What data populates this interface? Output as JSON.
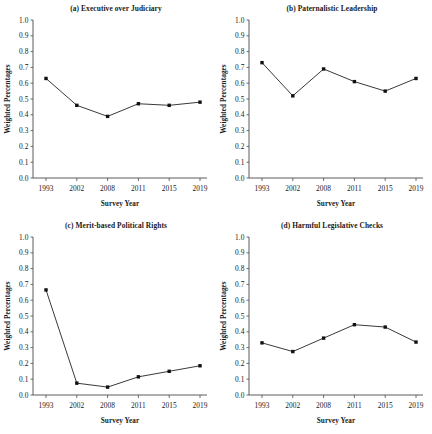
{
  "figure": {
    "panels": [
      {
        "id": "a",
        "title": "(a) Executive over Judiciary",
        "xlabel": "Survey Year",
        "ylabel": "Weighted Percentages"
      },
      {
        "id": "b",
        "title": "(b) Paternalistic Leadership",
        "xlabel": "Survey Year",
        "ylabel": "Weighted Percentages"
      },
      {
        "id": "c",
        "title": "(c) Merit-based Political Rights",
        "xlabel": "Survey Year",
        "ylabel": "Weighted Percentages"
      },
      {
        "id": "d",
        "title": "(d) Harmful Legislative Checks",
        "xlabel": "Survey Year",
        "ylabel": "Weighted Percentages"
      }
    ]
  },
  "chart_data": [
    {
      "type": "line",
      "title": "(a) Executive over Judiciary",
      "xlabel": "Survey Year",
      "ylabel": "Weighted Percentages",
      "categories": [
        "1993",
        "2002",
        "2008",
        "2011",
        "2015",
        "2019"
      ],
      "values": [
        0.63,
        0.46,
        0.39,
        0.47,
        0.46,
        0.48
      ],
      "ylim": [
        0.0,
        1.0
      ],
      "yticks": [
        "0.0",
        "0.1",
        "0.2",
        "0.3",
        "0.4",
        "0.5",
        "0.6",
        "0.7",
        "0.8",
        "0.9",
        "1.0"
      ],
      "grid": false,
      "legend": "none",
      "marker": "square"
    },
    {
      "type": "line",
      "title": "(b) Paternalistic Leadership",
      "xlabel": "Survey Year",
      "ylabel": "Weighted Percentages",
      "categories": [
        "1993",
        "2002",
        "2008",
        "2011",
        "2015",
        "2019"
      ],
      "values": [
        0.73,
        0.52,
        0.69,
        0.61,
        0.55,
        0.63
      ],
      "ylim": [
        0.0,
        1.0
      ],
      "yticks": [
        "0.0",
        "0.1",
        "0.2",
        "0.3",
        "0.4",
        "0.5",
        "0.6",
        "0.7",
        "0.8",
        "0.9",
        "1.0"
      ],
      "grid": false,
      "legend": "none",
      "marker": "square"
    },
    {
      "type": "line",
      "title": "(c) Merit-based Political Rights",
      "xlabel": "Survey Year",
      "ylabel": "Weighted Percentages",
      "categories": [
        "1993",
        "2002",
        "2008",
        "2011",
        "2015",
        "2019"
      ],
      "values": [
        0.665,
        0.075,
        0.05,
        0.115,
        0.15,
        0.185
      ],
      "ylim": [
        0.0,
        1.0
      ],
      "yticks": [
        "0.0",
        "0.1",
        "0.2",
        "0.3",
        "0.4",
        "0.5",
        "0.6",
        "0.7",
        "0.8",
        "0.9",
        "1.0"
      ],
      "grid": false,
      "legend": "none",
      "marker": "square"
    },
    {
      "type": "line",
      "title": "(d) Harmful Legislative Checks",
      "xlabel": "Survey Year",
      "ylabel": "Weighted Percentages",
      "categories": [
        "1993",
        "2002",
        "2008",
        "2011",
        "2015",
        "2019"
      ],
      "values": [
        0.33,
        0.275,
        0.36,
        0.445,
        0.43,
        0.335
      ],
      "ylim": [
        0.0,
        1.0
      ],
      "yticks": [
        "0.0",
        "0.1",
        "0.2",
        "0.3",
        "0.4",
        "0.5",
        "0.6",
        "0.7",
        "0.8",
        "0.9",
        "1.0"
      ],
      "grid": false,
      "legend": "none",
      "marker": "square"
    }
  ],
  "colors": {
    "line": "#222222",
    "marker": "#111111",
    "axis": "#4a4a4a",
    "text": "#1a1a1a",
    "background": "#ffffff"
  }
}
